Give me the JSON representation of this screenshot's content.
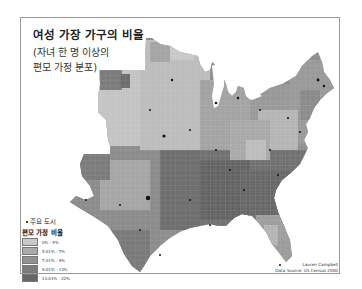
{
  "map": {
    "title": "여성 가장 가구의 비율",
    "subtitle_line1": "(자녀 한 명 이상의",
    "subtitle_line2": "편모 가정 분포)",
    "region": "Eastern and Central United States, county level",
    "legend": {
      "cities_label": "주요 도시",
      "cities_icon": "dot-icon",
      "heading": "편모 가정 비율",
      "classes": [
        {
          "label": "0% - 5%",
          "color": "#c9c9c9"
        },
        {
          "label": "5.01% - 7%",
          "color": "#aaaaaa"
        },
        {
          "label": "7.01% - 9%",
          "color": "#929292"
        },
        {
          "label": "9.01% - 13%",
          "color": "#7c7c7c"
        },
        {
          "label": "13.01% - 22%",
          "color": "#666666"
        }
      ]
    },
    "author": "Lauren Campbell",
    "source": "Data Source: US Census 2000"
  }
}
